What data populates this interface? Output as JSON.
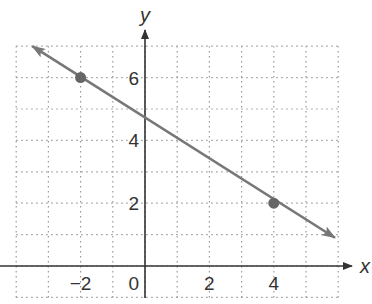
{
  "chart_data": {
    "type": "line",
    "title": "",
    "xlabel": "x",
    "ylabel": "y",
    "xlim": [
      -4,
      6
    ],
    "ylim": [
      -1,
      7
    ],
    "grid": true,
    "grid_style": "dotted",
    "x_ticks": [
      -2,
      0,
      2,
      4
    ],
    "y_ticks": [
      2,
      4,
      6
    ],
    "x_tick_labels": [
      "−2",
      "0",
      "2",
      "4"
    ],
    "y_tick_labels": [
      "2",
      "4",
      "6"
    ],
    "series": [
      {
        "name": "line",
        "equation": "y = -2/3 x + 14/3",
        "slope": -0.6667,
        "y_intercept": 4.667,
        "color": "#777777",
        "arrows": "both",
        "points": [
          {
            "x": -2,
            "y": 6
          },
          {
            "x": 4,
            "y": 2
          }
        ],
        "extent": [
          {
            "x": -3.5,
            "y": 7
          },
          {
            "x": 5.9,
            "y": 0.9
          }
        ]
      }
    ],
    "legend": null
  },
  "colors": {
    "axis": "#333333",
    "grid": "#999999",
    "line": "#777777",
    "point": "#666666"
  }
}
